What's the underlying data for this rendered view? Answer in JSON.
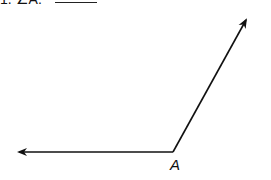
{
  "question": {
    "number": "1.",
    "text": "1. ∠A:",
    "answer_blank": ""
  },
  "figure": {
    "type": "angle",
    "vertex_label": "A",
    "vertex": [
      173,
      152
    ],
    "ray_left_tip": [
      17,
      152
    ],
    "ray_upper_tip": [
      247,
      18
    ],
    "stroke_color": "#111111"
  }
}
